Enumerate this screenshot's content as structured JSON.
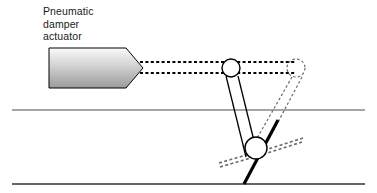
{
  "diagram": {
    "type": "mechanical-linkage-schematic",
    "canvas": {
      "width": 377,
      "height": 193,
      "background": "#ffffff"
    },
    "labels": {
      "actuator": {
        "line1": "Pneumatic",
        "line2": "damper",
        "line3": "actuator",
        "full_text": "Pneumatic damper actuator",
        "x": 43,
        "y": 5,
        "color": "#1a1a1a",
        "font_size_px": 10.5
      }
    },
    "colors": {
      "outline": "#000000",
      "rail": "#4d4d4d",
      "rail_bottom": "#333333",
      "ghost": "#6b6b6b",
      "body_fill_light": "#f2f2f2",
      "body_fill_dark": "#9a9a9a",
      "blade": "#000000",
      "text": "#1a1a1a"
    },
    "shapes": {
      "actuator_body": {
        "name": "pneumatic-damper-actuator-body",
        "description": "pentagon / bullet shaped actuator housing with vertical grey gradient fill",
        "points": "49,48 126,48 143,68 126,88 49,88",
        "fill": "vertical gradient light-to-dark grey",
        "stroke": "#000000",
        "stroke_width": 1
      },
      "push_rod": {
        "name": "actuator-push-rod",
        "description": "two parallel dashed horizontal lines from actuator tip to upper pivot and beyond to ghost pivot",
        "top_line": {
          "x1": 140,
          "y1": 62,
          "x2": 296,
          "y2": 62
        },
        "bottom_line": {
          "x1": 140,
          "y1": 73,
          "x2": 296,
          "y2": 73
        },
        "dash": "3,2.4",
        "stroke_width": 2.2,
        "stroke": "#000000"
      },
      "upper_pivot": {
        "name": "upper-pivot-joint",
        "cx": 231,
        "cy": 68,
        "r": 9,
        "fill": "#ffffff",
        "stroke": "#000000",
        "stroke_width": 1.4
      },
      "lower_pivot": {
        "name": "lower-pivot-joint",
        "cx": 256,
        "cy": 148,
        "r": 11,
        "fill": "#ffffff",
        "stroke": "#000000",
        "stroke_width": 1.4
      },
      "ghost_upper_pivot": {
        "name": "ghost-upper-pivot-joint",
        "cx": 296,
        "cy": 68,
        "r": 9,
        "fill": "none",
        "stroke": "#6b6b6b",
        "dash": "2.6,2.2",
        "stroke_width": 1.2
      },
      "linkage_arm_left": {
        "name": "linkage-arm-left",
        "x1": 226,
        "y1": 76,
        "x2": 246,
        "y2": 157,
        "stroke": "#000000",
        "stroke_width": 1.3
      },
      "linkage_arm_right": {
        "name": "linkage-arm-right",
        "x1": 238,
        "y1": 76,
        "x2": 258,
        "y2": 157,
        "stroke": "#000000",
        "stroke_width": 1.3
      },
      "ghost_linkage_arm_left": {
        "name": "ghost-linkage-arm-left",
        "x1": 292,
        "y1": 77,
        "x2": 248,
        "y2": 154,
        "stroke": "#6b6b6b",
        "dash": "2.6,2.2",
        "stroke_width": 1.2
      },
      "ghost_linkage_arm_right": {
        "name": "ghost-linkage-arm-right",
        "x1": 302,
        "y1": 77,
        "x2": 262,
        "y2": 152,
        "stroke": "#6b6b6b",
        "dash": "2.6,2.2",
        "stroke_width": 1.2
      },
      "damper_blade": {
        "name": "damper-blade-solid",
        "description": "thick black blade through lower pivot, closed position",
        "x1": 278,
        "y1": 120,
        "x2": 244,
        "y2": 184,
        "stroke": "#000000",
        "stroke_width": 3.2
      },
      "ghost_damper_blade_upper": {
        "name": "ghost-damper-blade-upper",
        "x1": 259,
        "y1": 152,
        "x2": 303,
        "y2": 138,
        "stroke": "#6b6b6b",
        "dash": "3,2.4",
        "stroke_width": 1.6
      },
      "ghost_damper_blade_lower": {
        "name": "ghost-damper-blade-lower",
        "x1": 253,
        "y1": 157,
        "x2": 219,
        "y2": 166,
        "stroke": "#6b6b6b",
        "dash": "3,2.4",
        "stroke_width": 1.6
      },
      "duct_wall_top": {
        "name": "duct-wall-top",
        "x1": 12,
        "y1": 110,
        "x2": 365,
        "y2": 110,
        "stroke": "#4d4d4d",
        "stroke_width": 1.1
      },
      "duct_wall_bottom": {
        "name": "duct-wall-bottom",
        "x1": 12,
        "y1": 184,
        "x2": 365,
        "y2": 184,
        "stroke": "#333333",
        "stroke_width": 1.6
      }
    }
  }
}
